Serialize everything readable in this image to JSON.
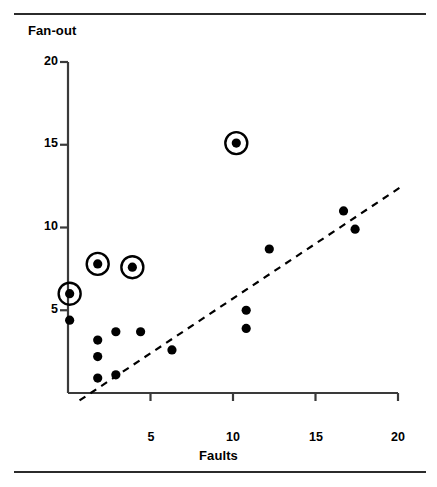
{
  "figure": {
    "has_top_rule": true,
    "has_bottom_rule": true,
    "rule_color": "#2b2b2b",
    "background": "#ffffff"
  },
  "chart_data": {
    "type": "scatter",
    "title": "",
    "xlabel": "Faults",
    "ylabel": "Fan-out",
    "xlim": [
      0,
      20
    ],
    "ylim": [
      0,
      20
    ],
    "xticks": [
      5,
      10,
      15,
      20
    ],
    "yticks": [
      5,
      10,
      15,
      20
    ],
    "xtick_labels": [
      "5",
      "10",
      "15",
      "20"
    ],
    "ytick_labels": [
      "5",
      "10",
      "15",
      "20"
    ],
    "grid": false,
    "legend": false,
    "marker_color": "#000000",
    "marker_radius": 4.6,
    "series": [
      {
        "name": "modules",
        "points": [
          {
            "x": 0.1,
            "y": 6.0,
            "highlighted": true
          },
          {
            "x": 1.8,
            "y": 7.8,
            "highlighted": true
          },
          {
            "x": 3.9,
            "y": 7.6,
            "highlighted": true
          },
          {
            "x": 10.2,
            "y": 15.1,
            "highlighted": true
          },
          {
            "x": 0.1,
            "y": 4.4,
            "highlighted": false
          },
          {
            "x": 1.8,
            "y": 3.2,
            "highlighted": false
          },
          {
            "x": 1.8,
            "y": 2.2,
            "highlighted": false
          },
          {
            "x": 1.8,
            "y": 0.9,
            "highlighted": false
          },
          {
            "x": 2.9,
            "y": 3.7,
            "highlighted": false
          },
          {
            "x": 2.9,
            "y": 1.1,
            "highlighted": false
          },
          {
            "x": 4.4,
            "y": 3.7,
            "highlighted": false
          },
          {
            "x": 6.3,
            "y": 2.6,
            "highlighted": false
          },
          {
            "x": 10.8,
            "y": 5.0,
            "highlighted": false
          },
          {
            "x": 10.8,
            "y": 3.9,
            "highlighted": false
          },
          {
            "x": 12.2,
            "y": 8.7,
            "highlighted": false
          },
          {
            "x": 16.7,
            "y": 11.0,
            "highlighted": false
          },
          {
            "x": 17.4,
            "y": 9.9,
            "highlighted": false
          }
        ]
      }
    ],
    "highlight_ring": {
      "style": "dashed-none",
      "outer_radius": 11,
      "stroke_width": 2.4,
      "color": "#000000",
      "count": 4
    },
    "trend_line": {
      "style": "dashed",
      "color": "#000000",
      "stroke_width": 2.2,
      "dash_pattern": "7 6",
      "x_start": 0.7,
      "y_start": -0.45,
      "x_end": 20.1,
      "y_end": 12.4
    }
  },
  "axes_geometry": {
    "x_zero_px": 68,
    "x_max_px": 398,
    "y_zero_px": 393,
    "y_max_px": 62,
    "tick_length_px": 8,
    "axis_color": "#3a3a3a",
    "axis_width": 2.2
  }
}
